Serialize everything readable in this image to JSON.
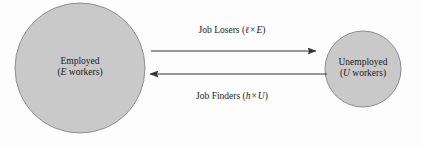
{
  "diagram": {
    "background_color": "#fdfdfd",
    "node_fill_color": "#c9c9c9",
    "node_stroke_color": "#8c8c8c",
    "arrow_color": "#333333",
    "text_color": "#1a1a1a",
    "nodes": [
      {
        "id": "employed",
        "name": "Employed",
        "sublabel_prefix": "(",
        "sublabel_symbol": "E",
        "sublabel_suffix": " workers)",
        "shape": "circle",
        "cx": 80,
        "cy": 68,
        "r": 65
      },
      {
        "id": "unemployed",
        "name": "Unemployed",
        "sublabel_prefix": "(",
        "sublabel_symbol": "U",
        "sublabel_suffix": " workers)",
        "shape": "circle",
        "cx": 363,
        "cy": 69,
        "r": 38
      }
    ],
    "flows": [
      {
        "id": "job-losers",
        "label": "Job Losers",
        "formula_open": "(",
        "formula_symbol1": "ℓ",
        "formula_operator": "×",
        "formula_symbol2": "E",
        "formula_close": ")",
        "direction": "right",
        "from": "employed",
        "to": "unemployed",
        "y": 51
      },
      {
        "id": "job-finders",
        "label": "Job Finders",
        "formula_open": "(",
        "formula_symbol1": "h",
        "formula_operator": "×",
        "formula_symbol2": "U",
        "formula_close": ")",
        "direction": "left",
        "from": "unemployed",
        "to": "employed",
        "y": 74
      }
    ]
  }
}
